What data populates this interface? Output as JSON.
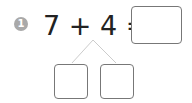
{
  "problem": {
    "number": "1",
    "expression": "7 + 4 =",
    "answer_value": "",
    "split_left_value": "",
    "split_right_value": ""
  },
  "colors": {
    "badge": "#a9a9a9",
    "text": "#222222",
    "box_border": "#777777",
    "branch_line": "#cccccc"
  }
}
